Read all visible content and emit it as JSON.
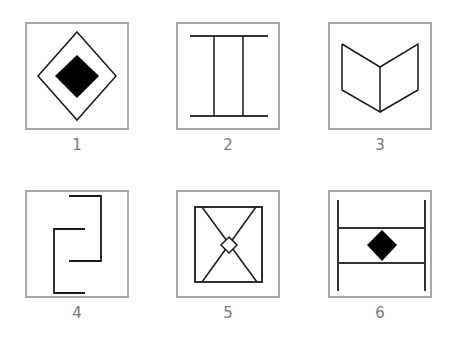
{
  "figures": [
    {
      "label": "1",
      "description": "square frame containing diamond outline with filled black diamond inside",
      "icon": "nested-diamond-icon"
    },
    {
      "label": "2",
      "description": "two horizontal lines joined by two vertical lines (H-like ladder)",
      "icon": "ladder-icon"
    },
    {
      "label": "3",
      "description": "open book / two parallelograms sharing a vertical edge",
      "icon": "open-book-icon"
    },
    {
      "label": "4",
      "description": "two interlocking bracket shapes",
      "icon": "interlocking-brackets-icon"
    },
    {
      "label": "5",
      "description": "square with diagonals crossing and small diamond at center",
      "icon": "hourglass-diamond-icon"
    },
    {
      "label": "6",
      "description": "two vertical lines with two horizontal rungs and filled black diamond between",
      "icon": "ladder-diamond-icon"
    }
  ],
  "colors": {
    "frame": "#a8a8a8",
    "stroke": "#1a1a1a",
    "fill": "#000000",
    "label": "#7a7a7a"
  }
}
